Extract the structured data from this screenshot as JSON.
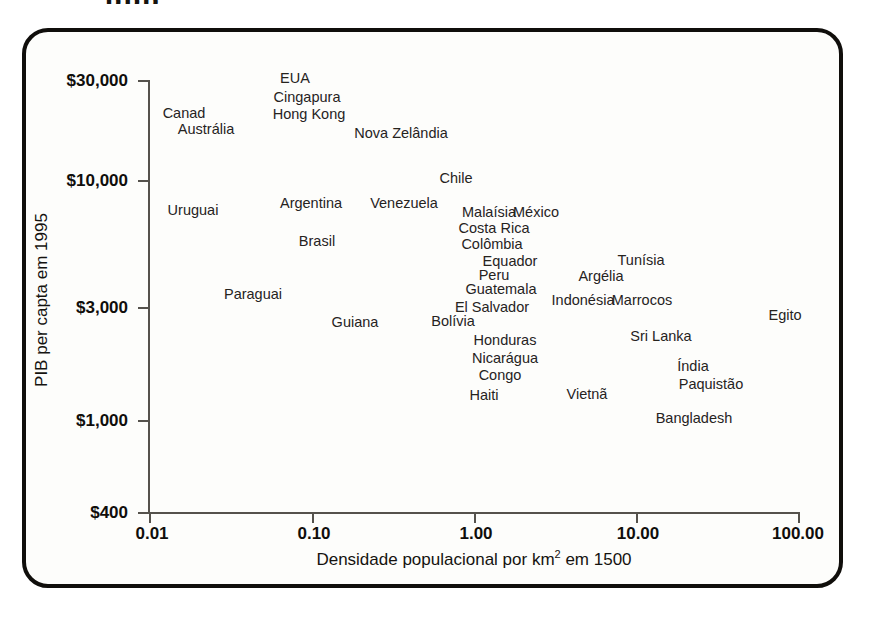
{
  "figure": {
    "scan_artifact_text": "ppp",
    "x_axis": {
      "title_main": "Densidade populacional por km",
      "title_exponent": "2",
      "title_tail": " em 1500",
      "title_full": "Densidade populacional por km² em 1500",
      "ticks": [
        "0.01",
        "0.10",
        "1.00",
        "10.00",
        "100.00"
      ]
    },
    "y_axis": {
      "title": "PIB per capta em 1995",
      "ticks": [
        "$30,000",
        "$10,000",
        "$3,000",
        "$1,000",
        "$400"
      ]
    }
  },
  "chart_data": {
    "type": "scatter",
    "title": "",
    "xlabel": "Densidade populacional por km² em 1500",
    "ylabel": "PIB per capta em 1995",
    "xscale": "log",
    "yscale": "log",
    "xlim": [
      0.01,
      100.0
    ],
    "ylim": [
      400,
      30000
    ],
    "xticks": [
      0.01,
      0.1,
      1.0,
      10.0,
      100.0
    ],
    "xticklabels": [
      "0.01",
      "0.10",
      "1.00",
      "10.00",
      "100.00"
    ],
    "yticks": [
      400,
      1000,
      3000,
      10000,
      30000
    ],
    "yticklabels": [
      "$400",
      "$1,000",
      "$3,000",
      "$10,000",
      "$30,000"
    ],
    "grid": false,
    "legend": false,
    "markers": "labels-only",
    "points": [
      {
        "label": "EUA",
        "x": 0.1,
        "y": 27000,
        "px": 295,
        "py": 78
      },
      {
        "label": "Cingapura",
        "x": 0.11,
        "y": 24000,
        "px": 307,
        "py": 97
      },
      {
        "label": "Hong Kong",
        "x": 0.11,
        "y": 21500,
        "px": 309,
        "py": 114
      },
      {
        "label": "Canad",
        "x": 0.022,
        "y": 22500,
        "px": 184,
        "py": 113
      },
      {
        "label": "Austrália",
        "x": 0.028,
        "y": 20000,
        "px": 206,
        "py": 129
      },
      {
        "label": "Nova Zelândia",
        "x": 0.38,
        "y": 19000,
        "px": 401,
        "py": 133
      },
      {
        "label": "Chile",
        "x": 1.35,
        "y": 11800,
        "px": 456,
        "py": 178
      },
      {
        "label": "Argentina",
        "x": 0.085,
        "y": 9200,
        "px": 311,
        "py": 203
      },
      {
        "label": "Venezuela",
        "x": 0.4,
        "y": 9200,
        "px": 404,
        "py": 203
      },
      {
        "label": "Uruguai",
        "x": 0.021,
        "y": 8600,
        "px": 193,
        "py": 210
      },
      {
        "label": "Malaísia",
        "x": 1.55,
        "y": 7700,
        "px": 489,
        "py": 212
      },
      {
        "label": "México",
        "x": 2.3,
        "y": 7700,
        "px": 536,
        "py": 212
      },
      {
        "label": "Costa Rica",
        "x": 1.55,
        "y": 6600,
        "px": 494,
        "py": 228
      },
      {
        "label": "Colômbia",
        "x": 1.55,
        "y": 5700,
        "px": 492,
        "py": 244
      },
      {
        "label": "Brasil",
        "x": 0.095,
        "y": 5600,
        "px": 317,
        "py": 241
      },
      {
        "label": "Equador",
        "x": 1.95,
        "y": 4900,
        "px": 510,
        "py": 261
      },
      {
        "label": "Tunísia",
        "x": 7.0,
        "y": 4900,
        "px": 641,
        "py": 260
      },
      {
        "label": "Peru",
        "x": 1.8,
        "y": 4400,
        "px": 494,
        "py": 275
      },
      {
        "label": "Argélia",
        "x": 5.2,
        "y": 4400,
        "px": 601,
        "py": 276
      },
      {
        "label": "Guatemala",
        "x": 1.9,
        "y": 4000,
        "px": 501,
        "py": 289
      },
      {
        "label": "Paraguai",
        "x": 0.05,
        "y": 3600,
        "px": 253,
        "py": 294
      },
      {
        "label": "El Salvador",
        "x": 1.9,
        "y": 3300,
        "px": 492,
        "py": 307
      },
      {
        "label": "Indonésia",
        "x": 4.6,
        "y": 3250,
        "px": 583,
        "py": 300
      },
      {
        "label": "Marrocos",
        "x": 6.8,
        "y": 3250,
        "px": 642,
        "py": 300
      },
      {
        "label": "Bolívia",
        "x": 1.3,
        "y": 3000,
        "px": 453,
        "py": 321
      },
      {
        "label": "Guiana",
        "x": 0.135,
        "y": 2900,
        "px": 355,
        "py": 322
      },
      {
        "label": "Egito",
        "x": 48.0,
        "y": 2950,
        "px": 785,
        "py": 315
      },
      {
        "label": "Honduras",
        "x": 2.05,
        "y": 2400,
        "px": 505,
        "py": 340
      },
      {
        "label": "Sri Lanka",
        "x": 9.2,
        "y": 2400,
        "px": 661,
        "py": 336
      },
      {
        "label": "Nicarágua",
        "x": 2.05,
        "y": 2050,
        "px": 505,
        "py": 358
      },
      {
        "label": "Índia",
        "x": 13.5,
        "y": 1900,
        "px": 693,
        "py": 366
      },
      {
        "label": "Congo",
        "x": 2.05,
        "y": 1780,
        "px": 500,
        "py": 375
      },
      {
        "label": "Paquistão",
        "x": 13.5,
        "y": 1680,
        "px": 711,
        "py": 384
      },
      {
        "label": "Haiti",
        "x": 1.85,
        "y": 1380,
        "px": 484,
        "py": 395
      },
      {
        "label": "Vietnã",
        "x": 4.0,
        "y": 1380,
        "px": 587,
        "py": 394
      },
      {
        "label": "Bangladesh",
        "x": 13.0,
        "y": 1120,
        "px": 694,
        "py": 418
      }
    ]
  }
}
